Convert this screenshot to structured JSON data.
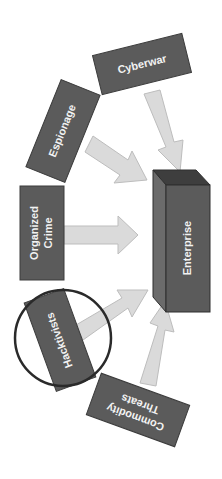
{
  "diagram": {
    "target": {
      "label": "Enterprise"
    },
    "sources": [
      {
        "id": "cyberwar",
        "label": "Cyberwar"
      },
      {
        "id": "espionage",
        "label": "Espionage"
      },
      {
        "id": "organized-crime",
        "label_line1": "Organized",
        "label_line2": "Crime"
      },
      {
        "id": "hacktivists",
        "label": "Hacktivists",
        "highlighted": true
      },
      {
        "id": "commodity-threats",
        "label_line1": "Commodity",
        "label_line2": "Threats"
      }
    ],
    "colors": {
      "box_fill": "#5b5b5b",
      "arrow_fill": "#dadada",
      "label_text": "#f2f2f2",
      "highlight_circle": "#2a2a2a"
    }
  }
}
